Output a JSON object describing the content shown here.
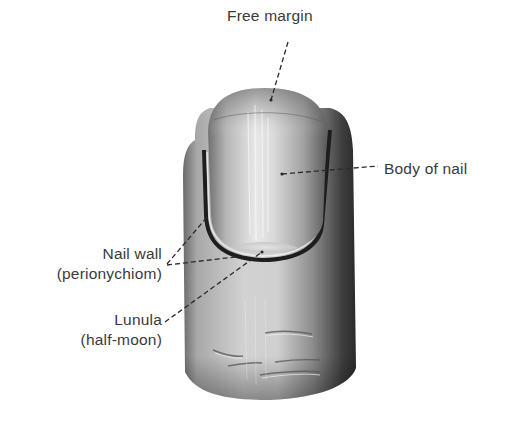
{
  "figure": {
    "labels": {
      "free_margin": "Free margin",
      "body_of_nail": "Body of nail",
      "nail_wall_line1": "Nail wall",
      "nail_wall_line2": "(perionychiom)",
      "lunula_line1": "Lunula",
      "lunula_line2": "(half-moon)"
    },
    "colors": {
      "background": "#ffffff",
      "label_text": "#3a3a3a",
      "leader_line": "#2a2a2a",
      "skin_light": "#d8d8d8",
      "skin_dark": "#2e2e2e",
      "nail_light": "#e6e6e6",
      "nail_dark": "#6a6a6a"
    }
  }
}
